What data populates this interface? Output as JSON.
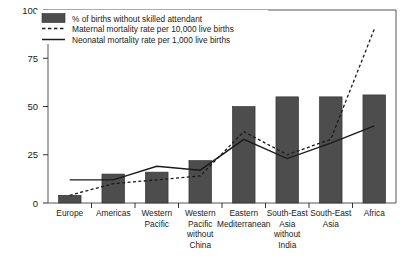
{
  "chart_data": {
    "type": "bar",
    "title": "",
    "subtitle": "",
    "xlabel": "",
    "ylabel": "",
    "ylim": [
      0,
      100
    ],
    "yticks": [
      0,
      25,
      50,
      75,
      100
    ],
    "ytick_labels": [
      "0",
      "25",
      "50",
      "75",
      "100"
    ],
    "grid": false,
    "legend_position": "top-left",
    "categories": [
      "Europe",
      "Americas",
      "Western Pacific",
      "Western Pacific without China",
      "Eastern Mediterranean",
      "South-East Asia without India",
      "South-East Asia",
      "Africa"
    ],
    "category_lines": [
      [
        "Europe"
      ],
      [
        "Americas"
      ],
      [
        "Western",
        "Pacific"
      ],
      [
        "Western",
        "Pacific",
        "without",
        "China"
      ],
      [
        "Eastern",
        "Mediterranean"
      ],
      [
        "South-East",
        "Asia",
        "without",
        "India"
      ],
      [
        "South-East",
        "Asia"
      ],
      [
        "Africa"
      ]
    ],
    "series": [
      {
        "name": "% of births without skilled attendant",
        "type": "bar",
        "color": "#4d4d4d",
        "values": [
          4,
          15,
          16,
          22,
          50,
          55,
          55,
          56
        ]
      },
      {
        "name": "Maternal mortality rate per 10,000 live births",
        "type": "line",
        "style": "dashed",
        "color": "#1a1a1a",
        "values": [
          4,
          10,
          12,
          14,
          37,
          25,
          33,
          90
        ]
      },
      {
        "name": "Neonatal mortality rate per 1,000 live births",
        "type": "line",
        "style": "solid",
        "color": "#1a1a1a",
        "values": [
          12,
          12,
          19,
          17,
          33,
          23,
          31,
          40
        ]
      }
    ]
  },
  "legend": {
    "items": [
      {
        "marker": "bar-swatch",
        "label": "% of births without skilled attendant"
      },
      {
        "marker": "dashed-line",
        "label": "Maternal mortality rate per 10,000 live births"
      },
      {
        "marker": "solid-line",
        "label": "Neonatal mortality rate per 1,000 live births"
      }
    ]
  },
  "axis": {
    "y_ticks": [
      "100",
      "75",
      "50",
      "25",
      "0"
    ]
  }
}
